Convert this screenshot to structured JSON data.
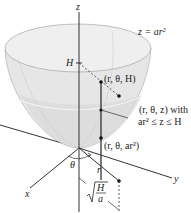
{
  "diagram": {
    "type": "3d-region-cylindrical-coordinates",
    "surface_label": "z = ar²",
    "axes": {
      "z": "z",
      "x": "x",
      "y": "y"
    },
    "height_marker": "H",
    "angle_label": "θ",
    "radius_label": "r",
    "radius_extent_label": "√(H/a)",
    "radius_extent_num": "H",
    "radius_extent_den": "a",
    "points": [
      {
        "label": "(r, θ, H)"
      },
      {
        "label": "(r, θ, z) with",
        "sublabel": "ar² ≤ z ≤ H"
      },
      {
        "label": "(r, θ, ar²)"
      }
    ],
    "colors": {
      "surface": "#e9e9e9",
      "surface_inner": "#d9d9d9",
      "rim": "#f3f3f3",
      "line": "#333333"
    }
  }
}
